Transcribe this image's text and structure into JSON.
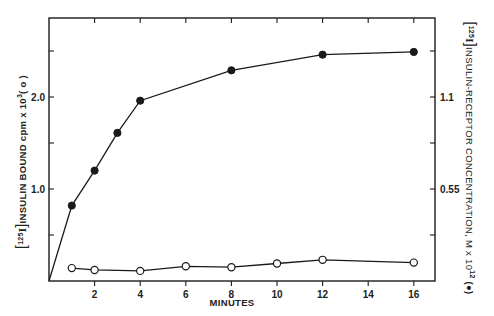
{
  "chart_data": {
    "type": "line",
    "title": "",
    "xlabel": "MINUTES",
    "ylabel": "[125I] INSULIN BOUND cpm x 10^3 (○)",
    "ylabel_right": "[125I] INSULIN-RECEPTOR CONCENTRATION, M x 10^12 (●)",
    "x_ticks": [
      2,
      4,
      6,
      8,
      10,
      12,
      14,
      16
    ],
    "x_tick_labels": [
      "2",
      "4",
      "6",
      "8",
      "10",
      "12",
      "14",
      "16"
    ],
    "xlim": [
      0,
      17
    ],
    "y_left_ticks": [
      0.5,
      1.0,
      1.5,
      2.0,
      2.5
    ],
    "y_left_tick_labels": [
      "",
      "1.0",
      "",
      "2.0",
      ""
    ],
    "ylim_left": [
      0,
      2.7
    ],
    "y_right_ticks": [
      0.275,
      0.55,
      0.825,
      1.1,
      1.375
    ],
    "y_right_tick_labels": [
      "",
      "0.55",
      "",
      "1.1",
      ""
    ],
    "ylim_right": [
      0,
      1.485
    ],
    "grid": false,
    "legend": "markers described in axis labels: open circle = insulin bound (left axis), filled circle = insulin-receptor concentration (right axis)",
    "series": [
      {
        "name": "[125I]insulin-receptor concentration (●)",
        "marker": "filled-circle",
        "x": [
          0,
          1,
          2,
          3,
          4,
          8,
          12,
          16
        ],
        "values": [
          0,
          0.82,
          1.2,
          1.61,
          1.96,
          2.29,
          2.46,
          2.49
        ]
      },
      {
        "name": "[125I]insulin bound cpm x 10^3 (○)",
        "marker": "open-circle",
        "x": [
          1,
          2,
          4,
          6,
          8,
          10,
          12,
          16
        ],
        "values": [
          0.14,
          0.12,
          0.11,
          0.16,
          0.15,
          0.19,
          0.23,
          0.2
        ]
      }
    ]
  },
  "labels": {
    "x_axis": "MINUTES",
    "left_axis": "INSULIN  BOUND  cpm x 10",
    "left_axis_sup": "3",
    "left_axis_suffix": "( o )",
    "left_prefix": "125",
    "left_prefix_elem": "I",
    "right_axis": "INSULIN-RECEPTOR  CONCENTRATION,  M x 10",
    "right_axis_sup": "12",
    "right_axis_suffix": "(●)",
    "right_prefix": "125",
    "right_prefix_elem": "I"
  },
  "colors": {
    "ink": "#1a1a1a",
    "background": "#ffffff"
  }
}
